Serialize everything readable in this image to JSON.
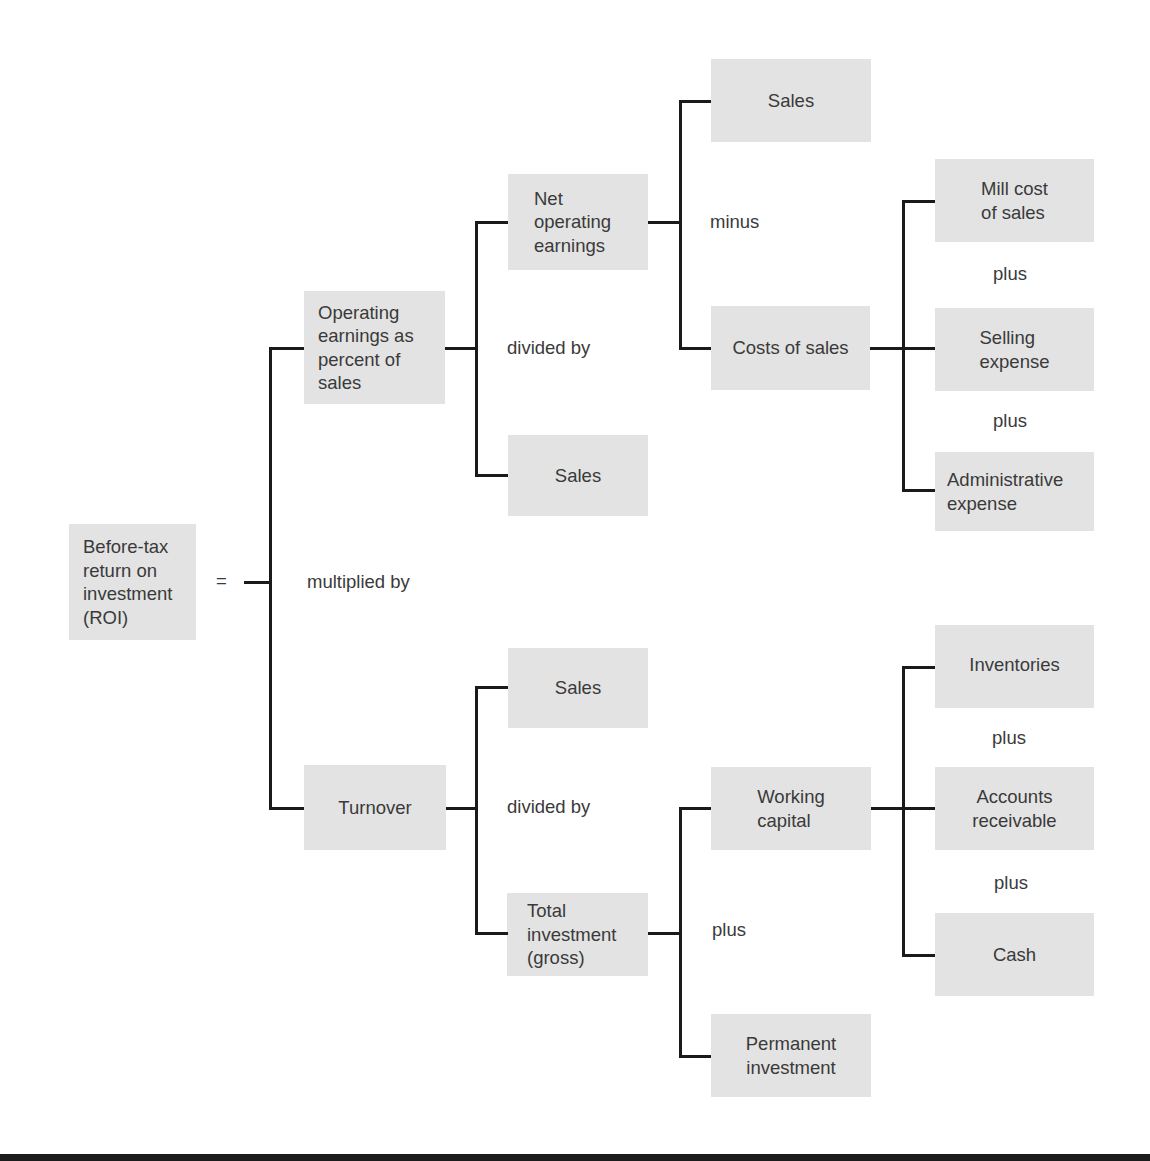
{
  "diagram": {
    "title_node": {
      "label": "Before-tax\nreturn on\ninvestment\n(ROI)"
    },
    "equals": "=",
    "operators": {
      "root": "multiplied by",
      "operating_earnings": "divided by",
      "net_operating_earnings": "minus",
      "costs_of_sales_plus_1": "plus",
      "costs_of_sales_plus_2": "plus",
      "turnover": "divided by",
      "total_investment": "plus",
      "working_capital_plus_1": "plus",
      "working_capital_plus_2": "plus"
    },
    "nodes": {
      "operating_earnings": "Operating\nearnings as\npercent of\nsales",
      "turnover": "Turnover",
      "net_operating_earnings": "Net\noperating\nearnings",
      "sales_oe": "Sales",
      "sales_top": "Sales",
      "costs_of_sales": "Costs of sales",
      "mill_cost": "Mill cost\nof sales",
      "selling_expense": "Selling\nexpense",
      "administrative_expense": "Administrative\nexpense",
      "sales_turnover": "Sales",
      "total_investment": "Total\ninvestment\n(gross)",
      "working_capital": "Working\ncapital",
      "permanent_investment": "Permanent\ninvestment",
      "inventories": "Inventories",
      "accounts_receivable": "Accounts\nreceivable",
      "cash": "Cash"
    },
    "colors": {
      "box_fill": "#e3e3e3",
      "line": "#1a1a1a",
      "text": "#3a3a3a"
    }
  }
}
